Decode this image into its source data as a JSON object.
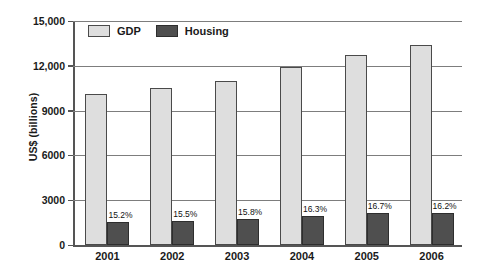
{
  "chart_data": {
    "type": "bar",
    "title": "",
    "subtitle": "",
    "xlabel": "",
    "ylabel": "US$ (billions)",
    "categories": [
      "2001",
      "2002",
      "2003",
      "2004",
      "2005",
      "2006"
    ],
    "series": [
      {
        "name": "GDP",
        "color": "#dedede",
        "values": [
          10100,
          10500,
          11000,
          11900,
          12700,
          13400
        ]
      },
      {
        "name": "Housing",
        "color": "#4f4f4f",
        "values": [
          1535,
          1628,
          1738,
          1940,
          2121,
          2171
        ],
        "data_labels": [
          "15.2%",
          "15.5%",
          "15.8%",
          "16.3%",
          "16.7%",
          "16.2%"
        ]
      }
    ],
    "ylim": [
      0,
      15000
    ],
    "yticks": [
      0,
      3000,
      6000,
      9000,
      12000,
      15000
    ],
    "ytick_labels": [
      "0",
      "3000",
      "6000",
      "9000",
      "12,000",
      "15,000"
    ],
    "grid": true,
    "legend_position": "top-left-inside",
    "legend_entries": [
      "GDP",
      "Housing"
    ]
  },
  "axis": {
    "y_title": "US$ (billions)"
  },
  "legend": {
    "items": [
      {
        "label": "GDP",
        "swatch": "legend-swatch-gdp"
      },
      {
        "label": "Housing",
        "swatch": "legend-swatch-housing"
      }
    ]
  }
}
